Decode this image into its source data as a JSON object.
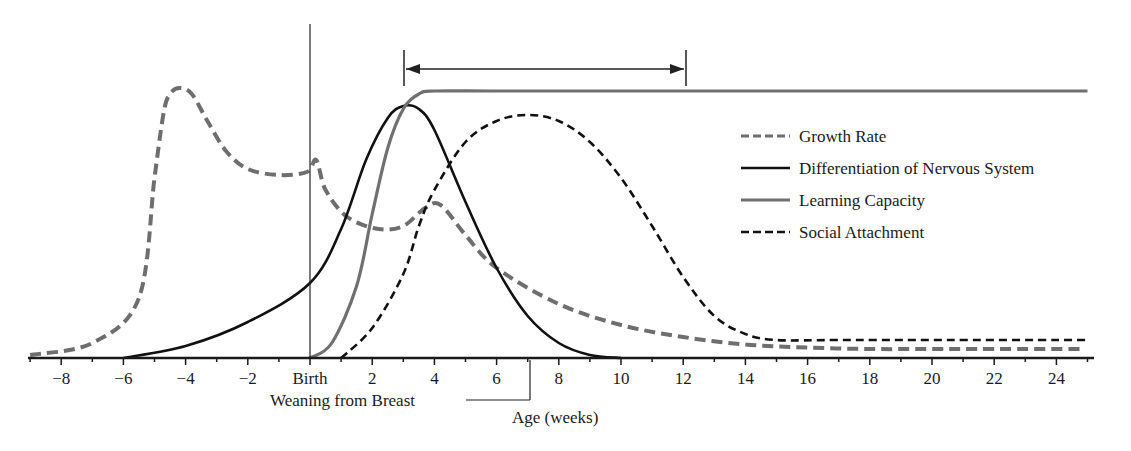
{
  "chart_data": {
    "type": "line",
    "title": "",
    "xlabel": "Age (weeks)",
    "ylabel": "",
    "xlim": [
      -9,
      25
    ],
    "ylim": [
      0,
      100
    ],
    "grid": false,
    "legend_position": "upper right (inside)",
    "x_ticks": [
      -8,
      -6,
      -4,
      -2,
      0,
      2,
      4,
      6,
      8,
      10,
      12,
      14,
      16,
      18,
      20,
      22,
      24
    ],
    "x_tick_labels": [
      "−8",
      "−6",
      "−4",
      "−2",
      "Birth",
      "2",
      "4",
      "6",
      "8",
      "10",
      "12",
      "14",
      "16",
      "18",
      "20",
      "22",
      "24"
    ],
    "series": [
      {
        "name": "Growth Rate",
        "style": "dashed",
        "color": "#6e6e6e",
        "x": [
          -9,
          -7,
          -5.5,
          -5,
          -4.7,
          -4.5,
          -4.2,
          -3.8,
          -3.3,
          -2.7,
          -2,
          -1,
          -0.1,
          0.2,
          0.5,
          1.2,
          2.2,
          3,
          3.7,
          4.2,
          5,
          6,
          8,
          10,
          12,
          14,
          16,
          18,
          20,
          22,
          24.8
        ],
        "values": [
          1,
          5,
          20,
          60,
          82,
          88,
          90,
          88,
          79,
          69,
          63,
          61,
          62,
          66,
          56,
          47,
          43,
          44,
          50,
          51,
          41,
          30,
          18,
          11,
          7,
          4.5,
          3.5,
          3,
          3,
          3,
          3
        ]
      },
      {
        "name": "Differentiation of Nervous System",
        "style": "solid",
        "color": "#111111",
        "x": [
          -6,
          -4,
          -2,
          0,
          1,
          1.8,
          2.5,
          3,
          3.5,
          4,
          5,
          6,
          7,
          8,
          9,
          10
        ],
        "values": [
          0,
          4,
          12,
          25,
          43,
          66,
          80,
          84,
          83,
          76,
          52,
          30,
          14,
          5,
          1,
          0
        ]
      },
      {
        "name": "Learning Capacity",
        "style": "solid",
        "color": "#707070",
        "x": [
          0,
          0.7,
          1.5,
          2,
          2.5,
          3,
          3.5,
          4,
          6,
          10,
          15,
          20,
          25
        ],
        "values": [
          0,
          5,
          24,
          48,
          70,
          83,
          88,
          89,
          89,
          89,
          89,
          89,
          89
        ]
      },
      {
        "name": "Social Attachment",
        "style": "dashed",
        "color": "#111111",
        "x": [
          1,
          2,
          3,
          3.5,
          4,
          5,
          6,
          7,
          8,
          9,
          10,
          11,
          12,
          13,
          14,
          15,
          17,
          20,
          25
        ],
        "values": [
          0,
          10,
          28,
          44,
          56,
          72,
          79,
          81,
          79,
          72,
          60,
          44,
          27,
          14,
          8,
          6,
          6,
          6,
          6
        ]
      }
    ],
    "annotations": [
      {
        "text": "Birth",
        "type": "vertical-line",
        "x": 0
      },
      {
        "text": "Weaning from Breast",
        "type": "bracket-label",
        "x": 7
      },
      {
        "text": "",
        "type": "double-arrow-range",
        "x_start": 3,
        "x_end": 12
      }
    ]
  },
  "legend": {
    "items": [
      {
        "label": "Growth Rate",
        "style": "dashed",
        "color": "#6e6e6e"
      },
      {
        "label": "Differentiation of Nervous System",
        "style": "solid",
        "color": "#111111"
      },
      {
        "label": "Learning Capacity",
        "style": "solid",
        "color": "#707070"
      },
      {
        "label": "Social Attachment",
        "style": "dashed",
        "color": "#111111"
      }
    ]
  },
  "axis": {
    "xlabel": "Age (weeks)",
    "birth_label": "Birth",
    "weaning_label": "Weaning from Breast"
  }
}
